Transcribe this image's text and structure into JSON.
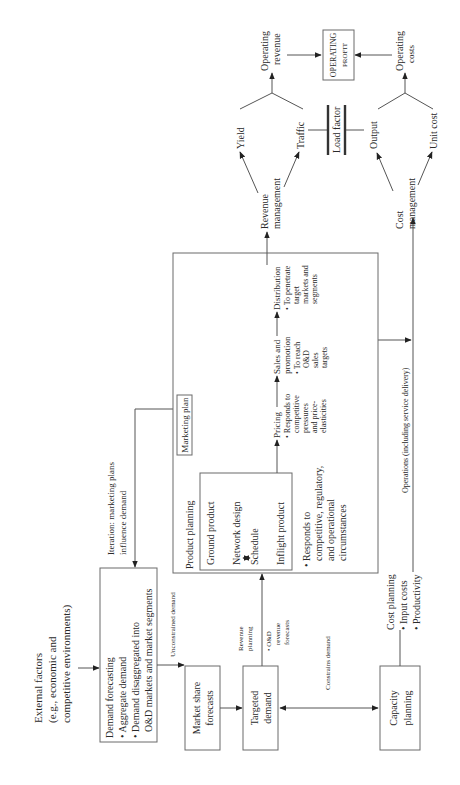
{
  "diagram": {
    "external_factors": [
      "External factors",
      "(e.g., economic and",
      "competitive environments)"
    ],
    "demand_forecasting": {
      "title": "Demand forecasting",
      "bullets": [
        "• Aggregate demand",
        "• Demand disaggregated into",
        "O&D markets and market segments"
      ]
    },
    "unconstrained_demand": "Unconstrained demand",
    "market_share": [
      "Market share",
      "forecasts"
    ],
    "targeted_demand": [
      "Targeted",
      "demand"
    ],
    "revenue_planning": [
      "Revenue",
      "planning",
      "• O&D",
      "revenue",
      "forecasts"
    ],
    "constrains_demand": "Constrains demand",
    "capacity_planning": [
      "Capacity",
      "planning"
    ],
    "cost_planning": [
      "Cost planning",
      "• Input costs",
      "• Productivity"
    ],
    "iteration": [
      "Iteration: marketing plans",
      "influence demand"
    ],
    "marketing_plan": "Marketing plan",
    "product_planning": "Product planning",
    "ground_product": "Ground product",
    "network_design": "Network design",
    "schedule": "Schedule",
    "inflight_product": "Inflight product",
    "product_responds": [
      "• Responds to",
      "competitive, regulatory,",
      "and operational",
      "circumstances"
    ],
    "pricing": [
      "Pricing",
      "• Responds to",
      "competitive",
      "pressures",
      "and price-",
      "elasticities"
    ],
    "sales_promotion": [
      "Sales and",
      "promotion",
      "• To reach",
      "O&D",
      "sales",
      "targets"
    ],
    "distribution": [
      "Distribution",
      "• To penetrate",
      "target",
      "markets and",
      "segments"
    ],
    "operations": "Operations (including service delivery)",
    "revenue_management": [
      "Revenue",
      "management"
    ],
    "cost_management": [
      "Cost",
      "management"
    ],
    "yield": "Yield",
    "traffic": "Traffic",
    "load_factor": "Load factor",
    "output": "Output",
    "unit_cost": "Unit cost",
    "operating_revenue": [
      "Operating",
      "revenue"
    ],
    "operating_costs": [
      "Operating",
      "costs"
    ],
    "operating_profit": [
      "OPERATING",
      "PROFIT"
    ]
  }
}
